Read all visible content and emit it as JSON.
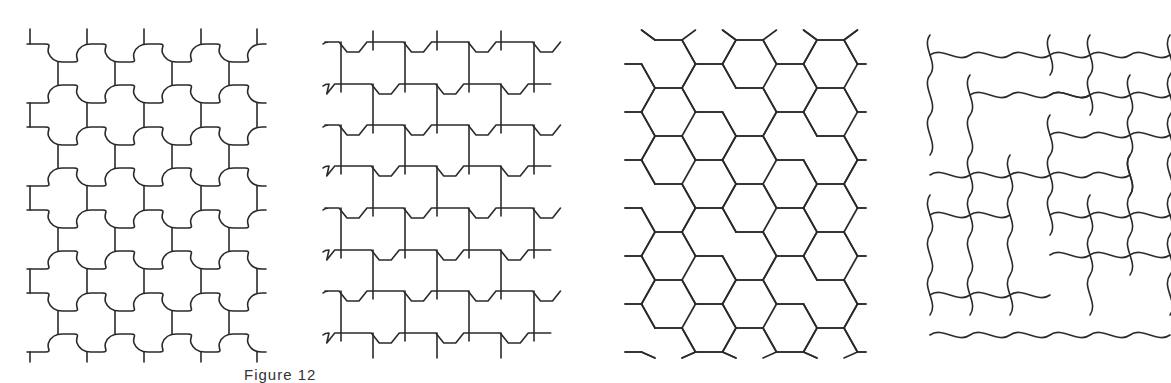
{
  "figure": {
    "caption": "Figure 12",
    "panel_count": 4,
    "stroke_color": "#2a2a2a",
    "background": "#ffffff"
  },
  "panels": [
    {
      "id": 1,
      "pattern": "cross-shaped interlocking tiles (puzzle bumps)"
    },
    {
      "id": 2,
      "pattern": "I-shaped (dog-bone) bricks in stretcher bond"
    },
    {
      "id": 3,
      "pattern": "hexagonal chevron tiles"
    },
    {
      "id": 4,
      "pattern": "wavy S-edged interlocking tiles in herringbone"
    }
  ]
}
